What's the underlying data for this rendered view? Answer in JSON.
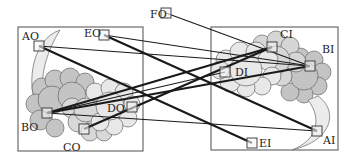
{
  "diagram": {
    "frames": [
      {
        "id": "left",
        "x": 18,
        "y": 27,
        "w": 125,
        "h": 124
      },
      {
        "id": "right",
        "x": 211,
        "y": 27,
        "w": 127,
        "h": 123
      }
    ],
    "nodes": [
      {
        "id": "FO",
        "label": "FO",
        "x": 166,
        "y": 13,
        "lx": 150,
        "ly": 18
      },
      {
        "id": "EO",
        "label": "EO",
        "x": 104,
        "y": 35,
        "lx": 84,
        "ly": 37
      },
      {
        "id": "AO",
        "label": "AO",
        "x": 39,
        "y": 46,
        "lx": 22,
        "ly": 40
      },
      {
        "id": "BO",
        "label": "BO",
        "x": 47,
        "y": 113,
        "lx": 21,
        "ly": 131
      },
      {
        "id": "CO",
        "label": "CO",
        "x": 84,
        "y": 129,
        "lx": 63,
        "ly": 151
      },
      {
        "id": "DO",
        "label": "DO",
        "x": 132,
        "y": 107,
        "lx": 107,
        "ly": 112
      },
      {
        "id": "CI",
        "label": "CI",
        "x": 272,
        "y": 47,
        "lx": 280,
        "ly": 38
      },
      {
        "id": "BI",
        "label": "BI",
        "x": 310,
        "y": 66,
        "lx": 322,
        "ly": 53
      },
      {
        "id": "DI",
        "label": "DI",
        "x": 225,
        "y": 72,
        "lx": 235,
        "ly": 76
      },
      {
        "id": "AI",
        "label": "AI",
        "x": 317,
        "y": 131,
        "lx": 323,
        "ly": 144
      },
      {
        "id": "EI",
        "label": "EI",
        "x": 252,
        "y": 143,
        "lx": 259,
        "ly": 147
      }
    ],
    "edges": [
      {
        "from": "FO",
        "to": "BI",
        "weight": "thin"
      },
      {
        "from": "EO",
        "to": "BI",
        "weight": "thin"
      },
      {
        "from": "EO",
        "to": "AI",
        "weight": "thick"
      },
      {
        "from": "AO",
        "to": "BI",
        "weight": "thin"
      },
      {
        "from": "AO",
        "to": "EI",
        "weight": "thick"
      },
      {
        "from": "BO",
        "to": "CI",
        "weight": "thick"
      },
      {
        "from": "BO",
        "to": "BI",
        "weight": "thick"
      },
      {
        "from": "BO",
        "to": "AI",
        "weight": "thin"
      },
      {
        "from": "CO",
        "to": "CI",
        "weight": "thick"
      },
      {
        "from": "BO",
        "to": "DI",
        "weight": "thin"
      }
    ],
    "colors": {
      "line": "#1a1a1a",
      "frame": "#6b6b6b",
      "cloud_light": "#e4e4e4",
      "cloud_mid": "#cfcfcf",
      "cloud_dark": "#b9b9b9",
      "moon": "#ececec"
    }
  }
}
